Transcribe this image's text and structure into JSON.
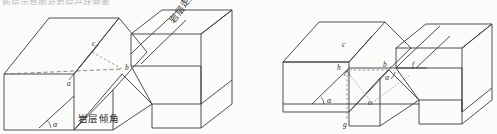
{
  "figure": {
    "background_color": "#fbfbf9",
    "line_color": "#3a3a3c",
    "width": 497,
    "height": 134,
    "top_cut_text": "断层示意图及岩层产状要素",
    "panels": [
      {
        "id": "left-panel",
        "name": "fault-block-diagram-left",
        "labels": [
          {
            "key": "c",
            "text": "c",
            "x": 94,
            "y": 46
          },
          {
            "key": "a",
            "text": "a",
            "x": 69,
            "y": 84
          },
          {
            "key": "b",
            "text": "b",
            "x": 127,
            "y": 69
          },
          {
            "key": "alpha",
            "text": "α",
            "x": 54,
            "y": 123
          }
        ],
        "annotations": [
          {
            "key": "dip_angle",
            "text": "岩层倾角"
          },
          {
            "key": "strike",
            "text": "岩层走向"
          }
        ]
      },
      {
        "id": "right-panel",
        "name": "fault-block-diagram-right",
        "labels": [
          {
            "key": "c",
            "text": "c",
            "x": 344,
            "y": 46
          },
          {
            "key": "h",
            "text": "h",
            "x": 341,
            "y": 71
          },
          {
            "key": "b",
            "text": "b",
            "x": 385,
            "y": 68
          },
          {
            "key": "f",
            "text": "f",
            "x": 413,
            "y": 68
          },
          {
            "key": "alpha_right",
            "text": "α",
            "x": 385,
            "y": 80
          },
          {
            "key": "alpha_left",
            "text": "α",
            "x": 327,
            "y": 104
          },
          {
            "key": "o",
            "text": "o",
            "x": 369,
            "y": 104
          },
          {
            "key": "g",
            "text": "g",
            "x": 344,
            "y": 124
          }
        ]
      }
    ]
  }
}
